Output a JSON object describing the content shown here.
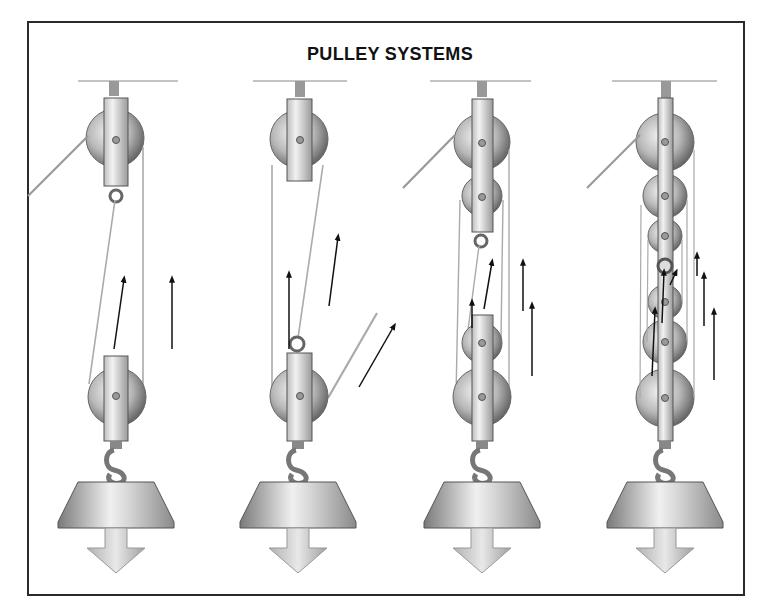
{
  "diagram": {
    "title": "PULLEY SYSTEMS",
    "colors": {
      "frame": "#2a2a2a",
      "metal_light": "#e6e6e6",
      "metal_dark": "#6e6e6e",
      "rope": "#9a9a9a",
      "arrow": "#111111",
      "background": "#ffffff"
    },
    "systems": [
      {
        "id": 1,
        "sheaves_fixed": 1,
        "sheaves_moving": 1,
        "supporting_ropes": 2,
        "force_arrows": 2
      },
      {
        "id": 2,
        "sheaves_fixed": 1,
        "sheaves_moving": 1,
        "supporting_ropes": 3,
        "force_arrows": 3
      },
      {
        "id": 3,
        "sheaves_fixed": 2,
        "sheaves_moving": 2,
        "supporting_ropes": 4,
        "force_arrows": 4
      },
      {
        "id": 4,
        "sheaves_fixed": 3,
        "sheaves_moving": 3,
        "supporting_ropes": 6,
        "force_arrows": 6
      }
    ],
    "load": {
      "shape": "truncated-cone-weight",
      "arrow_direction": "down"
    }
  }
}
